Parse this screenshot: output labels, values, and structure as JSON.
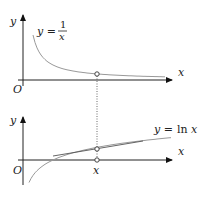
{
  "figure": {
    "top_panel": {
      "function_label": {
        "lhs": "y =",
        "numerator": "1",
        "denominator": "x"
      },
      "x_axis_label": "x",
      "y_axis_label": "y",
      "origin_label": "O"
    },
    "bottom_panel": {
      "function_label": {
        "lhs": "y =",
        "func": "ln",
        "arg": "x"
      },
      "x_axis_label": "x",
      "y_axis_label": "y",
      "origin_label": "O",
      "point_label": "x"
    },
    "colors": {
      "axis": "#222222",
      "curve": "#999999",
      "tangent": "#555555",
      "point": "#555555"
    }
  }
}
